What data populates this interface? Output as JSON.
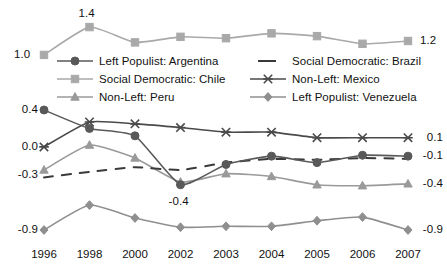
{
  "chart_data": {
    "type": "line",
    "title": "",
    "xlabel": "",
    "ylabel": "",
    "categories": [
      "1996",
      "1998",
      "2000",
      "2002",
      "2003",
      "2004",
      "2005",
      "2006",
      "2007"
    ],
    "panels": [
      {
        "name": "top-panel",
        "ylim": [
          0.95,
          1.45
        ],
        "grid": false,
        "value_labels": [
          {
            "text": "1.0",
            "series": "Social Democratic: Chile",
            "category": "1996",
            "value": 1.0
          },
          {
            "text": "1.4",
            "series": "Social Democratic: Chile",
            "category": "1998",
            "value": 1.4
          },
          {
            "text": "1.2",
            "series": "Social Democratic: Chile",
            "category": "2007",
            "value": 1.2
          }
        ],
        "series": [
          {
            "name": "Social Democratic: Chile",
            "marker": "square",
            "linestyle": "solid",
            "color": "#a9a9a9",
            "values": [
              1.0,
              1.4,
              1.18,
              1.26,
              1.24,
              1.31,
              1.27,
              1.16,
              1.2
            ]
          }
        ]
      },
      {
        "name": "main-panel",
        "ylim": [
          -1.0,
          0.45
        ],
        "grid": false,
        "ytick_labels_left": [
          "0.4",
          "0.0",
          "-0.3",
          "-0.9"
        ],
        "ytick_values_left": [
          0.4,
          0.0,
          -0.3,
          -0.9
        ],
        "ytick_labels_right": [
          "0.1",
          "-0.1",
          "-0.4",
          "-0.9"
        ],
        "ytick_values_right": [
          0.1,
          -0.1,
          -0.4,
          -0.9
        ],
        "annotations": [
          {
            "text": "-0.4",
            "series": "Left Populist: Argentina",
            "category": "2002",
            "value": -0.4
          }
        ],
        "series": [
          {
            "name": "Left Populist: Argentina",
            "marker": "circle",
            "linestyle": "solid",
            "color": "#595959",
            "values": [
              0.4,
              0.2,
              0.12,
              -0.41,
              -0.19,
              -0.1,
              -0.17,
              -0.09,
              -0.1
            ]
          },
          {
            "name": "Social Democratic: Brazil",
            "marker": "none",
            "linestyle": "dashed",
            "color": "#3a3a3a",
            "values": [
              -0.33,
              -0.27,
              -0.22,
              -0.25,
              -0.17,
              -0.13,
              -0.14,
              -0.12,
              -0.13
            ]
          },
          {
            "name": "Non-Left: Mexico",
            "marker": "x",
            "linestyle": "solid",
            "color": "#4a4a4a",
            "values": [
              0.0,
              0.27,
              0.25,
              0.21,
              0.16,
              0.16,
              0.1,
              0.1,
              0.1
            ]
          },
          {
            "name": "Non-Left: Peru",
            "marker": "triangle",
            "linestyle": "solid",
            "color": "#9a9a9a",
            "values": [
              -0.25,
              0.02,
              -0.12,
              -0.38,
              -0.29,
              -0.32,
              -0.41,
              -0.42,
              -0.4
            ]
          },
          {
            "name": "Left Populist: Venezuela",
            "marker": "diamond",
            "linestyle": "solid",
            "color": "#8f8f8f",
            "values": [
              -0.9,
              -0.63,
              -0.77,
              -0.87,
              -0.86,
              -0.86,
              -0.8,
              -0.76,
              -0.9
            ]
          }
        ]
      }
    ],
    "legend": {
      "position": "center",
      "columns": 2,
      "entries": [
        {
          "label": "Left Populist: Argentina",
          "marker": "circle",
          "linestyle": "solid",
          "color": "#595959"
        },
        {
          "label": "Social Democratic: Brazil",
          "marker": "none",
          "linestyle": "dashed",
          "color": "#3a3a3a"
        },
        {
          "label": "Social Democratic: Chile",
          "marker": "square",
          "linestyle": "solid",
          "color": "#a9a9a9"
        },
        {
          "label": "Non-Left: Mexico",
          "marker": "x",
          "linestyle": "solid",
          "color": "#4a4a4a"
        },
        {
          "label": "Non-Left: Peru",
          "marker": "triangle",
          "linestyle": "solid",
          "color": "#9a9a9a"
        },
        {
          "label": "Left Populist: Venezuela",
          "marker": "diamond",
          "linestyle": "solid",
          "color": "#8f8f8f"
        }
      ]
    }
  },
  "axis": {
    "x_ticks": [
      "1996",
      "1998",
      "2000",
      "2002",
      "2003",
      "2004",
      "2005",
      "2006",
      "2007"
    ],
    "y_left": [
      "0.4",
      "0.0",
      "-0.3",
      "-0.9"
    ],
    "y_right": [
      "0.1",
      "-0.1",
      "-0.4",
      "-0.9"
    ],
    "top_left_label": "1.0",
    "top_peak_label": "1.4",
    "top_right_label": "1.2",
    "inline_annotation": "-0.4"
  },
  "legend": {
    "e0": "Left Populist: Argentina",
    "e1": "Social Democratic: Brazil",
    "e2": "Social Democratic: Chile",
    "e3": "Non-Left: Mexico",
    "e4": "Non-Left: Peru",
    "e5": "Left Populist: Venezuela"
  }
}
